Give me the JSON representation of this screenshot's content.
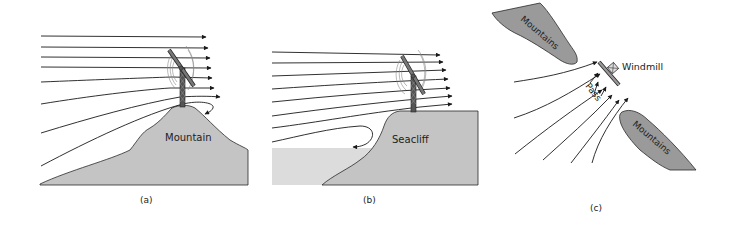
{
  "figure": {
    "panels": [
      {
        "id": "a",
        "caption": "(a)",
        "terrain_label": "Mountain",
        "description": "Wind streamlines accelerating over a mountain top with a windmill at the summit; a small eddy forms on the lee side."
      },
      {
        "id": "b",
        "caption": "(b)",
        "terrain_label": "Seacliff",
        "description": "Wind streamlines rising over a seacliff with a windmill at the cliff edge; a recirculating eddy forms at the base of the cliff over the sea."
      },
      {
        "id": "c",
        "caption": "(c)",
        "terrain_labels": [
          "Mountains",
          "Mountains"
        ],
        "pass_label": "Pass",
        "windmill_label": "Windmill",
        "description": "Plan view of wind funnelled through a mountain pass toward a windmill."
      }
    ]
  },
  "colors": {
    "land": "#c4c4c4",
    "sea": "#dcdcdc",
    "mountains_plan": "#9a9a9a",
    "lines": "#1a1a1a"
  }
}
